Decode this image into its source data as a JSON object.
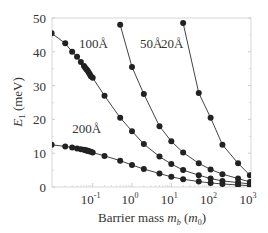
{
  "chart_data": {
    "type": "line",
    "title": "",
    "xlabel": "Barrier mass m_b (m_0)",
    "ylabel": "E_1 (meV)",
    "xscale": "log",
    "xlim": [
      0.009,
      1000
    ],
    "ylim": [
      0,
      50
    ],
    "x_ticks": [
      "10^-1",
      "10^0",
      "10^1",
      "10^2",
      "10^3"
    ],
    "y_ticks": [
      0,
      10,
      20,
      30,
      40,
      50
    ],
    "grid": false,
    "legend": "inline labels",
    "series": [
      {
        "name": "20Å",
        "label_pos": {
          "x": 5.5,
          "y": 41
        },
        "x": [
          20,
          50,
          100,
          200,
          500,
          1000
        ],
        "values": [
          48.5,
          27.8,
          20.5,
          12.5,
          7.0,
          3.5
        ]
      },
      {
        "name": "50Å",
        "label_pos": {
          "x": 1.6,
          "y": 41
        },
        "x": [
          0.5,
          1,
          2,
          5,
          10,
          20,
          50,
          100,
          200,
          500,
          1000
        ],
        "values": [
          48.0,
          35.5,
          27.5,
          18.0,
          13.5,
          10.2,
          7.0,
          5.2,
          3.8,
          2.5,
          1.5
        ]
      },
      {
        "name": "100Å",
        "label_pos": {
          "x": 0.045,
          "y": 41
        },
        "x": [
          0.009,
          0.02,
          0.03,
          0.04,
          0.05,
          0.06,
          0.065,
          0.07,
          0.075,
          0.08,
          0.085,
          0.09,
          0.1,
          0.2,
          0.5,
          1,
          2,
          5,
          10,
          20,
          50,
          100,
          200,
          500,
          1000
        ],
        "values": [
          45.5,
          42.5,
          40.0,
          38.5,
          37.0,
          35.8,
          35.2,
          34.8,
          34.3,
          33.8,
          33.3,
          32.8,
          32.3,
          27.0,
          20.5,
          16.5,
          12.7,
          9.0,
          6.8,
          5.0,
          3.5,
          2.5,
          1.8,
          1.3,
          0.9
        ]
      },
      {
        "name": "200Å",
        "label_pos": {
          "x": 0.03,
          "y": 16
        },
        "x": [
          0.009,
          0.02,
          0.03,
          0.04,
          0.05,
          0.06,
          0.065,
          0.07,
          0.075,
          0.08,
          0.09,
          0.1,
          0.2,
          0.5,
          1,
          2,
          5,
          10,
          20,
          50,
          100,
          200,
          500,
          1000
        ],
        "values": [
          12.5,
          12.0,
          11.7,
          11.4,
          11.2,
          11.0,
          10.9,
          10.8,
          10.7,
          10.6,
          10.4,
          10.2,
          9.2,
          7.8,
          6.5,
          5.3,
          4.0,
          3.0,
          2.3,
          1.6,
          1.2,
          0.9,
          0.6,
          0.4
        ]
      }
    ]
  },
  "axes": {
    "ylabel_main": "E",
    "ylabel_sub": "1",
    "ylabel_unit": " (meV)",
    "xlabel_main": "Barrier mass ",
    "xlabel_var": "m",
    "xlabel_var_sub": "b",
    "xlabel_unit_open": " (",
    "xlabel_unit_var": "m",
    "xlabel_unit_sub": "0",
    "xlabel_unit_close": ")"
  }
}
